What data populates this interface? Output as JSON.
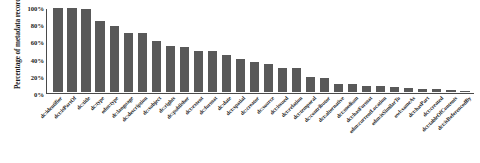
{
  "chart_data": {
    "type": "bar",
    "title": "",
    "subtitle": "",
    "xlabel": "",
    "ylabel": "Percentage of metadata records",
    "ylim": [
      0,
      100
    ],
    "ytick_labels": [
      "100%",
      "80%",
      "60%",
      "40%",
      "20%",
      "0%"
    ],
    "ytick_values": [
      100,
      80,
      60,
      40,
      20,
      0
    ],
    "grid": false,
    "legend": null,
    "legend_position": "none",
    "bar_color": "#595959",
    "axis_color": "#4a4a4a",
    "categories": [
      "dc:identifier",
      "dct:isPartOf",
      "dc:title",
      "dc:type",
      "edm:type",
      "dc:language",
      "dc:description",
      "dc:subject",
      "dc:rights",
      "dc:publisher",
      "dct:extent",
      "dc:format",
      "dc:date",
      "dct:spatial",
      "dc:creator",
      "dc:source",
      "dct:issued",
      "dct:relation",
      "dct:temporal",
      "dc:contributor",
      "dct:alternative",
      "dct:medium",
      "dct:hasFormat",
      "edm:currentLocation",
      "edm:isSimilarTo",
      "owl:sameAs",
      "dct:hasPart",
      "dct:created",
      "dct:tableOfContents",
      "dct:isReferencedBy"
    ],
    "values": [
      100,
      100,
      99,
      85,
      79,
      70,
      70,
      61,
      55,
      53,
      49,
      49,
      44,
      39,
      36,
      33,
      29,
      28,
      18,
      17,
      10,
      10,
      7,
      7,
      6,
      5,
      4,
      3,
      2,
      1
    ],
    "value_unit": "%"
  }
}
